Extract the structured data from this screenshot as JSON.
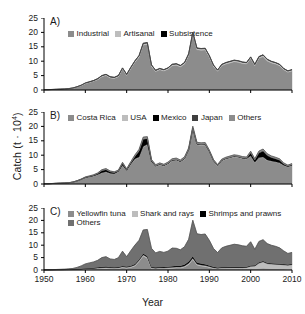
{
  "figure": {
    "ylabel_text": "Catch (t · 10",
    "ylabel_exp": "4",
    "ylabel_close": ")",
    "xlabel": "Year",
    "yticks": [
      "25",
      "20",
      "15",
      "10",
      "5",
      "0"
    ],
    "xticks": [
      "1950",
      "1960",
      "1970",
      "1980",
      "1990",
      "2000",
      "2010"
    ],
    "panel_a_label": "A)",
    "panel_b_label": "B)",
    "panel_c_label": "C)"
  },
  "colors": {
    "industrial": "#8c8c8c",
    "artisanal": "#bdbdbd",
    "subsistence": "#000000",
    "costa_rica": "#8c8c8c",
    "usa": "#bdbdbd",
    "mexico": "#000000",
    "japan": "#3f3f3f",
    "others_b": "#8c8c8c",
    "yellowfin": "#8c8c8c",
    "shark": "#bdbdbd",
    "shrimp": "#000000",
    "others_c": "#707070",
    "axis": "#000000"
  },
  "chart_data": [
    {
      "type": "area",
      "panel": "A",
      "title": "A)",
      "xlabel": "Year",
      "ylabel": "Catch (t · 10^4)",
      "xlim": [
        1950,
        2010
      ],
      "ylim": [
        0,
        25
      ],
      "grid": false,
      "legend_position": "top-left",
      "stacked": true,
      "x": [
        1950,
        1951,
        1952,
        1953,
        1954,
        1955,
        1956,
        1957,
        1958,
        1959,
        1960,
        1961,
        1962,
        1963,
        1964,
        1965,
        1966,
        1967,
        1968,
        1969,
        1970,
        1971,
        1972,
        1973,
        1974,
        1975,
        1976,
        1977,
        1978,
        1979,
        1980,
        1981,
        1982,
        1983,
        1984,
        1985,
        1986,
        1987,
        1988,
        1989,
        1990,
        1991,
        1992,
        1993,
        1994,
        1995,
        1996,
        1997,
        1998,
        1999,
        2000,
        2001,
        2002,
        2003,
        2004,
        2005,
        2006,
        2007,
        2008,
        2009,
        2010
      ],
      "series": [
        {
          "name": "Industrial",
          "color": "#8c8c8c",
          "values": [
            0.1,
            0.1,
            0.15,
            0.2,
            0.25,
            0.3,
            0.4,
            0.6,
            1.0,
            1.5,
            2.2,
            2.6,
            3.0,
            3.6,
            4.6,
            5.0,
            4.2,
            4.0,
            4.6,
            7.2,
            5.0,
            7.4,
            9.6,
            11.4,
            15.6,
            15.8,
            8.2,
            6.4,
            7.0,
            6.6,
            7.2,
            8.4,
            8.6,
            8.0,
            9.0,
            12.0,
            19.4,
            14.0,
            13.8,
            13.9,
            11.4,
            8.2,
            6.5,
            8.4,
            9.0,
            9.4,
            9.8,
            9.6,
            9.2,
            9.0,
            10.9,
            8.4,
            11.0,
            11.6,
            10.1,
            9.4,
            9.0,
            8.4,
            7.0,
            6.2,
            6.6
          ]
        },
        {
          "name": "Artisanal",
          "color": "#bdbdbd",
          "values": [
            0.02,
            0.02,
            0.03,
            0.04,
            0.05,
            0.06,
            0.08,
            0.1,
            0.12,
            0.15,
            0.2,
            0.22,
            0.25,
            0.3,
            0.35,
            0.38,
            0.35,
            0.34,
            0.36,
            0.4,
            0.38,
            0.42,
            0.45,
            0.5,
            0.55,
            0.55,
            0.45,
            0.4,
            0.42,
            0.4,
            0.42,
            0.45,
            0.46,
            0.45,
            0.48,
            0.5,
            0.55,
            0.5,
            0.5,
            0.5,
            0.46,
            0.4,
            0.36,
            0.42,
            0.45,
            0.46,
            0.48,
            0.48,
            0.46,
            0.45,
            0.5,
            0.44,
            0.5,
            0.52,
            0.5,
            0.48,
            0.46,
            0.44,
            0.4,
            0.38,
            0.4
          ]
        },
        {
          "name": "Subsistence",
          "color": "#000000",
          "values": [
            0.01,
            0.01,
            0.01,
            0.01,
            0.02,
            0.02,
            0.02,
            0.03,
            0.03,
            0.04,
            0.05,
            0.05,
            0.06,
            0.06,
            0.07,
            0.07,
            0.07,
            0.07,
            0.07,
            0.08,
            0.08,
            0.08,
            0.09,
            0.09,
            0.1,
            0.1,
            0.09,
            0.08,
            0.08,
            0.08,
            0.08,
            0.09,
            0.09,
            0.09,
            0.09,
            0.1,
            0.1,
            0.1,
            0.1,
            0.1,
            0.09,
            0.08,
            0.08,
            0.08,
            0.09,
            0.09,
            0.09,
            0.09,
            0.09,
            0.09,
            0.1,
            0.09,
            0.1,
            0.1,
            0.1,
            0.09,
            0.09,
            0.09,
            0.08,
            0.08,
            0.08
          ]
        }
      ],
      "legend": [
        "Industrial",
        "Artisanal",
        "Subsistence"
      ]
    },
    {
      "type": "area",
      "panel": "B",
      "title": "B)",
      "xlabel": "Year",
      "ylabel": "Catch (t · 10^4)",
      "xlim": [
        1950,
        2010
      ],
      "ylim": [
        0,
        25
      ],
      "grid": false,
      "legend_position": "top-left",
      "stacked": true,
      "x": [
        1950,
        1951,
        1952,
        1953,
        1954,
        1955,
        1956,
        1957,
        1958,
        1959,
        1960,
        1961,
        1962,
        1963,
        1964,
        1965,
        1966,
        1967,
        1968,
        1969,
        1970,
        1971,
        1972,
        1973,
        1974,
        1975,
        1976,
        1977,
        1978,
        1979,
        1980,
        1981,
        1982,
        1983,
        1984,
        1985,
        1986,
        1987,
        1988,
        1989,
        1990,
        1991,
        1992,
        1993,
        1994,
        1995,
        1996,
        1997,
        1998,
        1999,
        2000,
        2001,
        2002,
        2003,
        2004,
        2005,
        2006,
        2007,
        2008,
        2009,
        2010
      ],
      "series": [
        {
          "name": "Costa Rica",
          "color": "#8c8c8c",
          "values": [
            0.1,
            0.1,
            0.15,
            0.2,
            0.25,
            0.3,
            0.4,
            0.6,
            1.0,
            1.5,
            2.1,
            2.4,
            2.7,
            3.2,
            3.8,
            4.1,
            3.6,
            3.5,
            4.2,
            6.4,
            4.6,
            6.8,
            8.6,
            9.2,
            12.8,
            13.6,
            7.6,
            6.0,
            6.6,
            6.2,
            6.9,
            8.0,
            8.2,
            7.6,
            8.6,
            11.6,
            19.0,
            13.6,
            13.4,
            13.5,
            11.0,
            7.9,
            6.2,
            8.0,
            8.6,
            9.0,
            9.4,
            9.2,
            8.8,
            8.6,
            9.6,
            7.4,
            9.0,
            9.2,
            8.2,
            7.8,
            7.6,
            7.2,
            6.4,
            5.9,
            6.4
          ]
        },
        {
          "name": "USA",
          "color": "#bdbdbd",
          "values": [
            0.01,
            0.01,
            0.01,
            0.02,
            0.02,
            0.03,
            0.03,
            0.04,
            0.05,
            0.06,
            0.08,
            0.08,
            0.09,
            0.1,
            0.12,
            0.12,
            0.1,
            0.1,
            0.12,
            0.14,
            0.12,
            0.14,
            0.16,
            0.18,
            0.2,
            0.2,
            0.16,
            0.14,
            0.14,
            0.14,
            0.15,
            0.16,
            0.16,
            0.16,
            0.18,
            0.2,
            0.22,
            0.2,
            0.2,
            0.2,
            0.18,
            0.14,
            0.12,
            0.14,
            0.16,
            0.16,
            0.16,
            0.16,
            0.16,
            0.16,
            0.18,
            0.14,
            0.16,
            0.18,
            0.16,
            0.16,
            0.14,
            0.14,
            0.12,
            0.12,
            0.12
          ]
        },
        {
          "name": "Mexico",
          "color": "#000000",
          "values": [
            0.0,
            0.0,
            0.0,
            0.0,
            0.0,
            0.0,
            0.0,
            0.0,
            0.02,
            0.05,
            0.1,
            0.15,
            0.2,
            0.3,
            0.7,
            0.75,
            0.5,
            0.35,
            0.2,
            0.55,
            0.25,
            0.4,
            0.8,
            2.0,
            2.5,
            1.9,
            0.35,
            0.2,
            0.2,
            0.15,
            0.15,
            0.15,
            0.15,
            0.15,
            0.15,
            0.15,
            0.15,
            0.15,
            0.15,
            0.15,
            0.15,
            0.12,
            0.1,
            0.12,
            0.12,
            0.12,
            0.12,
            0.12,
            0.12,
            0.14,
            1.0,
            0.8,
            1.6,
            2.0,
            1.5,
            1.2,
            1.0,
            0.9,
            0.4,
            0.2,
            0.2
          ]
        },
        {
          "name": "Japan",
          "color": "#3f3f3f",
          "values": [
            0.0,
            0.0,
            0.0,
            0.0,
            0.0,
            0.0,
            0.0,
            0.0,
            0.01,
            0.02,
            0.03,
            0.04,
            0.05,
            0.06,
            0.1,
            0.1,
            0.08,
            0.06,
            0.05,
            0.08,
            0.05,
            0.06,
            0.1,
            0.15,
            0.18,
            0.14,
            0.05,
            0.04,
            0.04,
            0.04,
            0.04,
            0.04,
            0.04,
            0.04,
            0.04,
            0.04,
            0.04,
            0.04,
            0.04,
            0.04,
            0.04,
            0.03,
            0.03,
            0.03,
            0.03,
            0.03,
            0.03,
            0.03,
            0.03,
            0.04,
            0.12,
            0.1,
            0.18,
            0.22,
            0.18,
            0.14,
            0.12,
            0.1,
            0.06,
            0.04,
            0.04
          ]
        },
        {
          "name": "Others",
          "color": "#8c8c8c",
          "values": [
            0.02,
            0.02,
            0.02,
            0.03,
            0.03,
            0.04,
            0.05,
            0.06,
            0.08,
            0.1,
            0.14,
            0.15,
            0.16,
            0.2,
            0.25,
            0.28,
            0.24,
            0.22,
            0.26,
            0.35,
            0.28,
            0.36,
            0.44,
            0.5,
            0.6,
            0.6,
            0.4,
            0.32,
            0.34,
            0.32,
            0.36,
            0.42,
            0.44,
            0.4,
            0.45,
            0.55,
            0.64,
            0.5,
            0.5,
            0.5,
            0.42,
            0.32,
            0.28,
            0.34,
            0.38,
            0.4,
            0.42,
            0.42,
            0.4,
            0.4,
            0.48,
            0.36,
            0.5,
            0.54,
            0.48,
            0.44,
            0.42,
            0.4,
            0.34,
            0.3,
            0.34
          ]
        }
      ],
      "legend": [
        "Costa Rica",
        "USA",
        "Mexico",
        "Japan",
        "Others"
      ]
    },
    {
      "type": "area",
      "panel": "C",
      "title": "C)",
      "xlabel": "Year",
      "ylabel": "Catch (t · 10^4)",
      "xlim": [
        1950,
        2010
      ],
      "ylim": [
        0,
        25
      ],
      "grid": false,
      "legend_position": "top-left",
      "stacked": true,
      "x": [
        1950,
        1951,
        1952,
        1953,
        1954,
        1955,
        1956,
        1957,
        1958,
        1959,
        1960,
        1961,
        1962,
        1963,
        1964,
        1965,
        1966,
        1967,
        1968,
        1969,
        1970,
        1971,
        1972,
        1973,
        1974,
        1975,
        1976,
        1977,
        1978,
        1979,
        1980,
        1981,
        1982,
        1983,
        1984,
        1985,
        1986,
        1987,
        1988,
        1989,
        1990,
        1991,
        1992,
        1993,
        1994,
        1995,
        1996,
        1997,
        1998,
        1999,
        2000,
        2001,
        2002,
        2003,
        2004,
        2005,
        2006,
        2007,
        2008,
        2009,
        2010
      ],
      "series": [
        {
          "name": "Yellowfin tuna",
          "color": "#8c8c8c",
          "values": [
            0.02,
            0.02,
            0.03,
            0.04,
            0.05,
            0.06,
            0.08,
            0.1,
            0.15,
            0.2,
            0.3,
            0.35,
            0.4,
            0.5,
            0.6,
            0.65,
            0.55,
            0.5,
            0.6,
            0.9,
            0.7,
            1.0,
            1.6,
            3.4,
            5.6,
            4.6,
            0.5,
            0.4,
            0.5,
            0.5,
            0.6,
            0.7,
            0.8,
            0.8,
            1.2,
            2.2,
            4.2,
            2.0,
            1.6,
            1.4,
            1.0,
            0.6,
            0.4,
            0.5,
            0.5,
            0.5,
            0.5,
            0.5,
            0.5,
            0.5,
            0.6,
            0.5,
            0.6,
            0.7,
            0.6,
            0.55,
            0.5,
            0.45,
            0.4,
            0.35,
            0.4
          ]
        },
        {
          "name": "Shark and rays",
          "color": "#bdbdbd",
          "values": [
            0.02,
            0.02,
            0.03,
            0.04,
            0.05,
            0.06,
            0.08,
            0.1,
            0.12,
            0.15,
            0.2,
            0.22,
            0.25,
            0.3,
            0.35,
            0.38,
            0.34,
            0.32,
            0.34,
            0.4,
            0.36,
            0.4,
            0.45,
            0.5,
            0.55,
            0.55,
            0.4,
            0.35,
            0.36,
            0.35,
            0.38,
            0.4,
            0.42,
            0.4,
            0.44,
            0.5,
            0.55,
            0.45,
            0.45,
            0.45,
            0.4,
            0.34,
            0.3,
            0.36,
            0.4,
            0.42,
            0.44,
            0.44,
            0.44,
            0.5,
            0.9,
            1.1,
            2.2,
            2.6,
            2.0,
            1.9,
            1.8,
            1.8,
            1.7,
            1.6,
            1.8
          ]
        },
        {
          "name": "Shrimps and prawns",
          "color": "#000000",
          "values": [
            0.02,
            0.02,
            0.03,
            0.04,
            0.05,
            0.06,
            0.08,
            0.1,
            0.12,
            0.15,
            0.2,
            0.22,
            0.24,
            0.28,
            0.32,
            0.34,
            0.3,
            0.3,
            0.32,
            0.36,
            0.34,
            0.36,
            0.4,
            0.44,
            0.48,
            0.48,
            0.36,
            0.32,
            0.34,
            0.34,
            0.36,
            0.42,
            0.46,
            0.5,
            0.6,
            0.7,
            0.8,
            0.6,
            0.55,
            0.5,
            0.45,
            0.36,
            0.3,
            0.34,
            0.36,
            0.36,
            0.36,
            0.36,
            0.34,
            0.34,
            0.36,
            0.3,
            0.34,
            0.36,
            0.34,
            0.32,
            0.3,
            0.3,
            0.28,
            0.26,
            0.28
          ]
        },
        {
          "name": "Others",
          "color": "#707070",
          "values": [
            0.05,
            0.05,
            0.07,
            0.09,
            0.12,
            0.16,
            0.22,
            0.33,
            0.66,
            1.15,
            1.75,
            2.08,
            2.36,
            2.82,
            3.73,
            4.0,
            3.26,
            3.12,
            3.7,
            5.92,
            3.96,
            6.04,
            7.6,
            7.62,
            9.52,
            10.72,
            7.48,
            5.81,
            6.3,
            5.89,
            6.26,
            7.32,
            7.07,
            6.44,
            7.13,
            8.98,
            14.5,
            11.55,
            11.7,
            12.15,
            10.1,
            7.38,
            6.04,
            7.7,
            8.28,
            8.67,
            9.07,
            8.87,
            8.47,
            8.2,
            9.52,
            6.43,
            8.36,
            8.56,
            7.7,
            7.2,
            6.95,
            6.38,
            5.3,
            4.45,
            4.6
          ]
        }
      ],
      "legend": [
        "Yellowfin tuna",
        "Shark and rays",
        "Shrimps and prawns",
        "Others"
      ]
    }
  ]
}
